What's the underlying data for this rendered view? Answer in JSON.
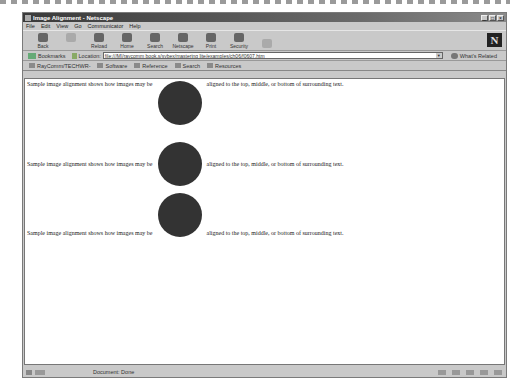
{
  "window": {
    "title": "Image Alignment - Netscape",
    "controls": [
      "_",
      "□",
      "×"
    ]
  },
  "menu": [
    "File",
    "Edit",
    "View",
    "Go",
    "Communicator",
    "Help"
  ],
  "toolbar": [
    {
      "label": "Back",
      "icon": "back-icon",
      "disabled": false
    },
    {
      "label": "Forward",
      "icon": "forward-icon",
      "disabled": true
    },
    {
      "label": "Reload",
      "icon": "reload-icon",
      "disabled": false
    },
    {
      "label": "Home",
      "icon": "home-icon",
      "disabled": false
    },
    {
      "label": "Search",
      "icon": "search-icon",
      "disabled": false
    },
    {
      "label": "Netscape",
      "icon": "netscape-icon",
      "disabled": false
    },
    {
      "label": "Print",
      "icon": "print-icon",
      "disabled": false
    },
    {
      "label": "Security",
      "icon": "security-icon",
      "disabled": false
    },
    {
      "label": "",
      "icon": "stop-icon",
      "disabled": true
    }
  ],
  "logo": "N",
  "location": {
    "bookmarks_label": "Bookmarks",
    "location_label": "Location:",
    "url": "file:///M|/raycomm book.s/sybex/mastering lite/examples/ch06/f0607.htm",
    "related_label": "What's Related"
  },
  "personal": [
    "RayComm/TECHWR-",
    "Software",
    "Reference",
    "Search",
    "Resources"
  ],
  "content": {
    "before": "Sample image alignment shows how images may be",
    "after": "aligned to the top, middle, or bottom of surrounding text.",
    "circle_color": "#333333"
  },
  "status": {
    "text": "Document: Done"
  }
}
